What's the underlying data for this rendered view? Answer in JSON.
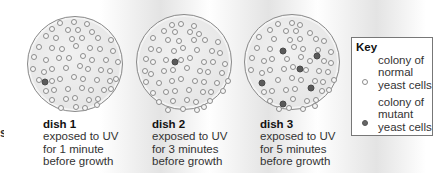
{
  "edge_text": "s",
  "colors": {
    "dish_rim": "#8a8a8a",
    "dish_fill": "#e6e6e6",
    "normal_colony_stroke": "#8c8c8c",
    "mutant_colony_fill": "#5a5a5a"
  },
  "colony_pattern": [
    [
      -14,
      -40
    ],
    [
      -2,
      -41
    ],
    [
      9,
      -39
    ],
    [
      -23,
      -34
    ],
    [
      -9,
      -33
    ],
    [
      4,
      -33
    ],
    [
      16,
      -31
    ],
    [
      -32,
      -27
    ],
    [
      -19,
      -25
    ],
    [
      -5,
      -24
    ],
    [
      8,
      -25
    ],
    [
      22,
      -25
    ],
    [
      33,
      -23
    ],
    [
      -36,
      -16
    ],
    [
      -25,
      -15
    ],
    [
      -12,
      -14
    ],
    [
      0,
      -17
    ],
    [
      12,
      -15
    ],
    [
      25,
      -14
    ],
    [
      36,
      -12
    ],
    [
      -40,
      -6
    ],
    [
      -30,
      -3
    ],
    [
      -19,
      -5
    ],
    [
      -6,
      -5
    ],
    [
      6,
      -7
    ],
    [
      18,
      -3
    ],
    [
      30,
      -3
    ],
    [
      40,
      -1
    ],
    [
      -42,
      6
    ],
    [
      -33,
      9
    ],
    [
      -22,
      6
    ],
    [
      -10,
      5
    ],
    [
      2,
      3
    ],
    [
      13,
      6
    ],
    [
      24,
      7
    ],
    [
      36,
      8
    ],
    [
      -37,
      17
    ],
    [
      -26,
      18
    ],
    [
      -15,
      16
    ],
    [
      -3,
      14
    ],
    [
      9,
      16
    ],
    [
      21,
      17
    ],
    [
      32,
      18
    ],
    [
      41,
      16
    ],
    [
      -31,
      28
    ],
    [
      -20,
      27
    ],
    [
      -8,
      26
    ],
    [
      4,
      25
    ],
    [
      16,
      27
    ],
    [
      27,
      27
    ],
    [
      37,
      26
    ],
    [
      -24,
      37
    ],
    [
      -12,
      36
    ],
    [
      0,
      35
    ],
    [
      12,
      37
    ],
    [
      24,
      36
    ],
    [
      -15,
      45
    ],
    [
      -2,
      44
    ],
    [
      10,
      45
    ],
    [
      20,
      42
    ]
  ],
  "dishes": [
    {
      "id": "dish1",
      "cx": 75,
      "cy": 64,
      "r": 48,
      "title": "dish 1",
      "line1": "exposed to UV",
      "line2": "for 1 minute",
      "line3": "before growth",
      "caption_x": 43,
      "mutants": [
        [
          -31,
          17
        ]
      ]
    },
    {
      "id": "dish2",
      "cx": 184,
      "cy": 62,
      "r": 48,
      "title": "dish 2",
      "line1": "exposed to UV",
      "line2": "for 3 minutes",
      "line3": "before growth",
      "caption_x": 152,
      "mutants": [
        [
          -10,
          -1
        ]
      ]
    },
    {
      "id": "dish3",
      "cx": 292,
      "cy": 62,
      "r": 48,
      "title": "dish 3",
      "line1": "exposed to UV",
      "line2": "for 5 minutes",
      "line3": "before growth",
      "caption_x": 260,
      "mutants": [
        [
          -10,
          -12
        ],
        [
          24,
          -7
        ],
        [
          7,
          6
        ],
        [
          -31,
          20
        ],
        [
          18,
          25
        ],
        [
          -10,
          41
        ]
      ]
    }
  ],
  "key": {
    "title": "Key",
    "normal": {
      "line1": "colony of",
      "line2": "normal",
      "line3": "yeast cells"
    },
    "mutant": {
      "line1": "colony of",
      "line2": "mutant",
      "line3": "yeast cells"
    }
  }
}
